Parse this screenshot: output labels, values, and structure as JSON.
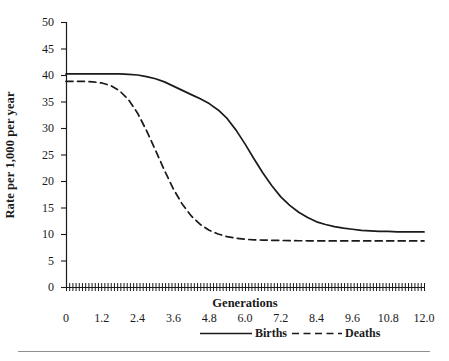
{
  "chart_data": {
    "type": "line",
    "title": "",
    "xlabel": "Generations",
    "ylabel": "Rate per 1,000 per year",
    "xlim": [
      0,
      12.0
    ],
    "ylim": [
      0,
      50
    ],
    "xticks": [
      "0",
      "1.2",
      "2.4",
      "3.6",
      "4.8",
      "6.0",
      "7.2",
      "8.4",
      "9.6",
      "10.8",
      "12.0"
    ],
    "xtick_values": [
      0,
      1.2,
      2.4,
      3.6,
      4.8,
      6.0,
      7.2,
      8.4,
      9.6,
      10.8,
      12.0
    ],
    "yticks": [
      "0",
      "5",
      "10",
      "15",
      "20",
      "25",
      "30",
      "35",
      "40",
      "45",
      "50"
    ],
    "ytick_values": [
      0,
      5,
      10,
      15,
      20,
      25,
      30,
      35,
      40,
      45,
      50
    ],
    "grid": false,
    "legend_position": "below-axis",
    "x": [
      0,
      0.3,
      0.6,
      0.9,
      1.2,
      1.5,
      1.8,
      2.1,
      2.4,
      2.7,
      3.0,
      3.3,
      3.6,
      3.9,
      4.2,
      4.5,
      4.8,
      5.1,
      5.4,
      5.7,
      6.0,
      6.3,
      6.6,
      6.9,
      7.2,
      7.5,
      7.8,
      8.1,
      8.4,
      8.7,
      9.0,
      9.3,
      9.6,
      9.9,
      10.2,
      10.5,
      10.8,
      11.1,
      11.4,
      11.7,
      12.0
    ],
    "series": [
      {
        "name": "Births",
        "style": "solid",
        "color": "#1a1a1a",
        "start_value": 40.2,
        "end_value": 10.4,
        "midpoint_x": 6.0,
        "values": [
          40.2,
          40.2,
          40.2,
          40.2,
          40.2,
          40.2,
          40.2,
          40.1,
          40.0,
          39.7,
          39.3,
          38.7,
          37.9,
          37.1,
          36.3,
          35.5,
          34.6,
          33.4,
          31.8,
          29.6,
          27.0,
          24.2,
          21.5,
          19.1,
          17.0,
          15.4,
          14.1,
          13.1,
          12.3,
          11.8,
          11.4,
          11.1,
          10.9,
          10.7,
          10.6,
          10.5,
          10.5,
          10.4,
          10.4,
          10.4,
          10.4
        ]
      },
      {
        "name": "Deaths",
        "style": "dashed",
        "color": "#1a1a1a",
        "start_value": 38.8,
        "end_value": 8.7,
        "midpoint_x": 3.0,
        "values": [
          38.8,
          38.8,
          38.8,
          38.7,
          38.5,
          38.0,
          37.0,
          35.3,
          32.8,
          29.5,
          25.8,
          22.0,
          18.5,
          15.6,
          13.4,
          11.8,
          10.7,
          10.0,
          9.5,
          9.2,
          9.0,
          8.9,
          8.85,
          8.8,
          8.78,
          8.75,
          8.73,
          8.72,
          8.71,
          8.7,
          8.7,
          8.7,
          8.7,
          8.7,
          8.7,
          8.7,
          8.7,
          8.7,
          8.7,
          8.7,
          8.7
        ]
      }
    ],
    "legend": [
      {
        "label": "Births",
        "style": "solid"
      },
      {
        "label": "Deaths",
        "style": "dashed"
      }
    ]
  },
  "figure": {
    "background": "#ffffff",
    "axis_color": "#1a1a1a",
    "rule_color": "#8f8f8f"
  }
}
